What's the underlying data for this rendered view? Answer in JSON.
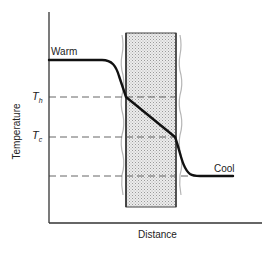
{
  "diagram": {
    "type": "temperature profile across a layer",
    "x_axis_label": "Distance",
    "y_axis_label": "Temperature",
    "labels": {
      "warm": "Warm",
      "cool": "Cool",
      "t_h": "T",
      "t_h_sub": "h",
      "t_c": "T",
      "t_c_sub": "c"
    },
    "levels": [
      {
        "name": "Warm",
        "y": 60
      },
      {
        "name": "T_h",
        "y": 97
      },
      {
        "name": "T_c",
        "y": 137
      },
      {
        "name": "Cool",
        "y": 176
      }
    ],
    "shaded_region": {
      "x_start": 126,
      "x_end": 176,
      "y_top": 33,
      "y_bottom": 207,
      "fill": "#d8d8d8"
    },
    "colors": {
      "line": "#111111",
      "axis": "#333333",
      "dash": "#555555"
    }
  }
}
